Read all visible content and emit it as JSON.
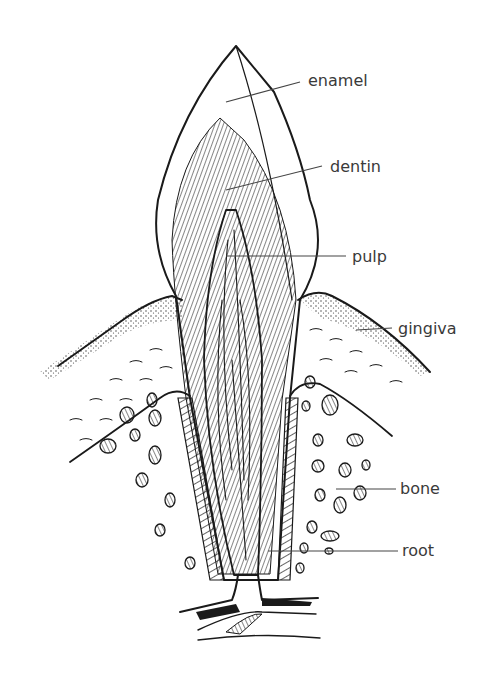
{
  "diagram": {
    "labels": [
      {
        "id": "enamel",
        "text": "enamel"
      },
      {
        "id": "dentin",
        "text": "dentin"
      },
      {
        "id": "pulp",
        "text": "pulp"
      },
      {
        "id": "gingiva",
        "text": "gingiva"
      },
      {
        "id": "bone",
        "text": "bone"
      },
      {
        "id": "root",
        "text": "root"
      }
    ],
    "colors": {
      "ink": "#1a1a1a",
      "label": "#3a3a3a",
      "background": "#ffffff"
    }
  }
}
